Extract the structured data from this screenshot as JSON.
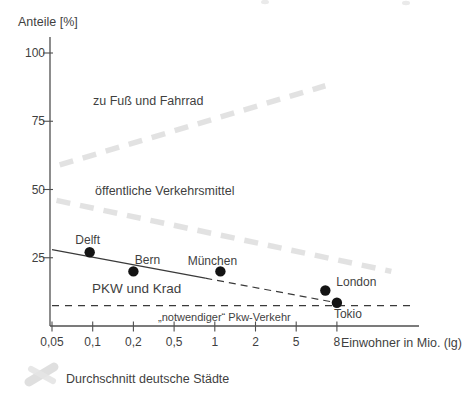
{
  "colors": {
    "background": "#ffffff",
    "text": "#3f3f3f",
    "axis": "#4f4f4f",
    "line": "#3a3a3a",
    "point": "#141414",
    "band": "#dedede"
  },
  "chart_data": {
    "type": "scatter",
    "x_axis": {
      "label": "Einwohner in Mio. (lg)",
      "scale": "log",
      "tick_labels": [
        "0,05",
        "0,1",
        "0,2",
        "0,5",
        "1",
        "2",
        "5",
        "8"
      ],
      "tick_values": [
        0.05,
        0.1,
        0.2,
        0.5,
        1,
        2,
        5,
        8
      ]
    },
    "y_axis": {
      "label": "Anteile [%]",
      "tick_labels": [
        "25",
        "50",
        "75",
        "100"
      ],
      "tick_values": [
        25,
        50,
        75,
        100
      ],
      "range": [
        0,
        105
      ]
    },
    "points": [
      {
        "name": "Delft",
        "x": 0.095,
        "share_pct": 27,
        "label": {
          "dx": -2,
          "dy": -8,
          "anchor": "middle"
        }
      },
      {
        "name": "Bern",
        "x": 0.2,
        "share_pct": 20,
        "label": {
          "dx": 14,
          "dy": -7,
          "anchor": "middle"
        }
      },
      {
        "name": "München",
        "x": 1.1,
        "share_pct": 20,
        "label": {
          "dx": -8,
          "dy": -6,
          "anchor": "middle"
        }
      },
      {
        "name": "London",
        "x": 7,
        "share_pct": 13,
        "label": {
          "dx": 11,
          "dy": -5,
          "anchor": "start"
        }
      },
      {
        "name": "Tokio",
        "x": 8,
        "share_pct": 8.5,
        "label": {
          "dx": -3,
          "dy": 15,
          "anchor": "start"
        }
      }
    ],
    "lines": [
      {
        "name": "pkw-krad-boundary",
        "from": {
          "x": 0.05,
          "share_pct": 28
        },
        "to": {
          "x": 8,
          "share_pct": 8.5
        },
        "solid_until_x": 0.85
      },
      {
        "name": "notwendiger-pkw-level",
        "share_pct": 7.5,
        "from_x": 0.05,
        "style": "dashed"
      }
    ],
    "bands": [
      {
        "name": "fuss-fahrrad-boundary-average",
        "from": {
          "x": 0.057,
          "share_pct": 59
        },
        "to": {
          "x": 7,
          "share_pct": 88
        }
      },
      {
        "name": "oev-pkw-boundary-average",
        "from": {
          "x": 0.054,
          "share_pct": 46
        },
        "to": {
          "x": 15,
          "share_pct": 20
        }
      }
    ],
    "region_labels": [
      {
        "text": "zu Fuß und Fahrrad"
      },
      {
        "text": "öffentliche Verkehrsmittel"
      },
      {
        "text": "PKW und Krad"
      },
      {
        "text": "„notwendiger“ Pkw-Verkehr"
      }
    ],
    "legend": {
      "swatch": "gray-smudge",
      "label": "Durchschnitt deutsche Städte"
    }
  }
}
